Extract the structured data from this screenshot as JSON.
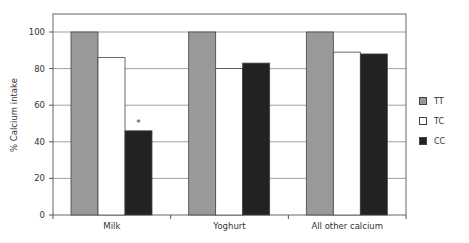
{
  "chart_data": {
    "type": "bar",
    "title": "",
    "xlabel": "",
    "ylabel": "% Calcium intake",
    "ylim": [
      0,
      105
    ],
    "yticks": [
      0,
      20,
      40,
      60,
      80,
      100
    ],
    "grid": true,
    "legend_position": "right",
    "categories": [
      "Milk",
      "Yoghurt",
      "All other calcium"
    ],
    "series": [
      {
        "name": "TT",
        "color": "#999999",
        "values": [
          100,
          100,
          100
        ]
      },
      {
        "name": "TC",
        "color": "#ffffff",
        "values": [
          86,
          80,
          89
        ]
      },
      {
        "name": "CC",
        "color": "#222222",
        "values": [
          46,
          83,
          88
        ]
      }
    ],
    "annotations": [
      {
        "category": "Milk",
        "series": "CC",
        "text": "*"
      }
    ]
  },
  "legend": {
    "items": [
      {
        "label": "TT",
        "color": "#999999"
      },
      {
        "label": "TC",
        "color": "#ffffff"
      },
      {
        "label": "CC",
        "color": "#222222"
      }
    ]
  }
}
